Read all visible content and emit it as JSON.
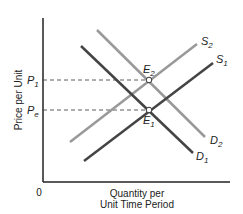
{
  "chart_data": {
    "type": "line",
    "title": "",
    "xlabel": "Quantity per Unit Time Period",
    "xlabel_lines": [
      "Quantity per",
      "Unit Time Period"
    ],
    "ylabel": "Price per Unit",
    "origin_label": "0",
    "grid": false,
    "legend": "none (curves labeled directly)",
    "series": [
      {
        "name": "S1",
        "sub": "1",
        "base": "S",
        "kind": "supply",
        "color": "#444444",
        "points": [
          [
            84,
            161
          ],
          [
            213,
            63
          ]
        ]
      },
      {
        "name": "S2",
        "sub": "2",
        "base": "S",
        "kind": "supply",
        "color": "#999999",
        "points": [
          [
            70,
            142
          ],
          [
            197,
            44
          ]
        ]
      },
      {
        "name": "D1",
        "sub": "1",
        "base": "D",
        "kind": "demand",
        "color": "#444444",
        "points": [
          [
            81,
            46
          ],
          [
            193,
            153
          ]
        ]
      },
      {
        "name": "D2",
        "sub": "2",
        "base": "D",
        "kind": "demand",
        "color": "#999999",
        "points": [
          [
            97,
            30
          ],
          [
            205,
            137
          ]
        ]
      }
    ],
    "equilibria": [
      {
        "name": "E1",
        "base": "E",
        "sub": "1",
        "x": 149,
        "y": 110,
        "price_label": "Pe",
        "price_base": "P",
        "price_sub": "e"
      },
      {
        "name": "E2",
        "base": "E",
        "sub": "2",
        "x": 149,
        "y": 80,
        "price_label": "P1",
        "price_base": "P",
        "price_sub": "1"
      }
    ],
    "y_ticks": [
      "P1",
      "Pe"
    ],
    "x_ticks": [],
    "annotation": "Supply shifts left from S1 to S2 and demand shifts right from D1 to D2; equilibrium moves from E1 at price Pe to E2 at higher price P1 with quantity unchanged."
  }
}
